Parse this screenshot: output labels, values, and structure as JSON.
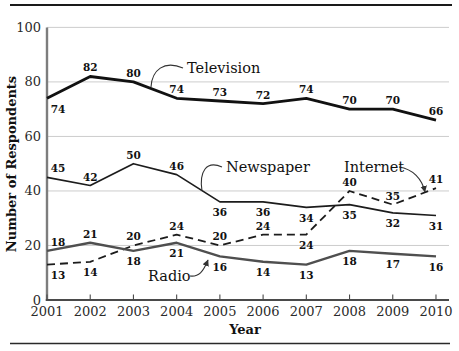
{
  "page": {
    "background": "#ffffff",
    "rule_color": "#1a1a1a"
  },
  "chart_data": {
    "type": "line",
    "title": "",
    "xlabel": "Year",
    "ylabel": "Number of Respondents",
    "x": [
      2001,
      2002,
      2003,
      2004,
      2005,
      2006,
      2007,
      2008,
      2009,
      2010
    ],
    "ylim": [
      0,
      100
    ],
    "yticks": [
      0,
      20,
      40,
      60,
      80,
      100
    ],
    "grid": "horizontal",
    "legend_position": "inline-annotations",
    "series": [
      {
        "name": "Television",
        "values": [
          74,
          82,
          80,
          74,
          73,
          72,
          74,
          70,
          70,
          66
        ],
        "color": "#111111",
        "line": "solid",
        "width": 2.8,
        "label_side": [
          "br",
          "a",
          "a",
          "a",
          "a",
          "a",
          "a",
          "a",
          "a",
          "a"
        ]
      },
      {
        "name": "Newspaper",
        "values": [
          45,
          42,
          50,
          46,
          36,
          36,
          34,
          35,
          32,
          31
        ],
        "color": "#1c1c1c",
        "line": "solid",
        "width": 1.7,
        "label_side": [
          "ar",
          "a",
          "a",
          "a",
          "b",
          "b",
          "b",
          "b",
          "b",
          "b"
        ]
      },
      {
        "name": "Internet",
        "values": [
          13,
          14,
          20,
          24,
          20,
          24,
          24,
          40,
          35,
          41
        ],
        "color": "#1c1c1c",
        "line": "dashed",
        "width": 1.8,
        "label_side": [
          "br",
          "b",
          "a",
          "a",
          "a",
          "a",
          "b",
          "a",
          "a",
          "a"
        ]
      },
      {
        "name": "Radio",
        "values": [
          18,
          21,
          18,
          21,
          16,
          14,
          13,
          18,
          17,
          16
        ],
        "color": "#4f4f4f",
        "line": "solid",
        "width": 2.4,
        "label_side": [
          "ar",
          "a",
          "b",
          "b",
          "b",
          "b",
          "b",
          "b",
          "b",
          "b"
        ]
      }
    ],
    "annotations": [
      {
        "text": "Television",
        "text_x": 187,
        "text_y": 73,
        "anchor": "start",
        "path": "M 183 68 C 164 60 152 70 151 87",
        "arrow": false
      },
      {
        "text": "Newspaper",
        "text_x": 226,
        "text_y": 172,
        "anchor": "start",
        "path": "M 222 167 C 206 160 199 172 202 191",
        "arrow": false
      },
      {
        "text": "Internet",
        "text_x": 344,
        "text_y": 172,
        "anchor": "start",
        "path": "M 399 167 C 413 169 422 179 425 192",
        "arrow": true
      },
      {
        "text": "Radio",
        "text_x": 148,
        "text_y": 281,
        "anchor": "start",
        "path": "M 190 276 C 199 277 203 272 208 260",
        "arrow": true
      }
    ]
  }
}
